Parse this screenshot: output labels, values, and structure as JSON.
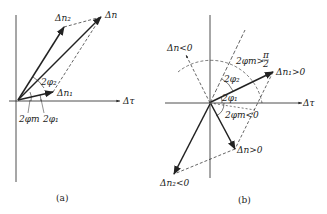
{
  "panel_a": {
    "caption": "(a)",
    "labels": {
      "dn2": "Δn₂",
      "dn": "Δn",
      "dn1": "Δn₁",
      "dtau": "Δτ",
      "phi2": "2φ₂",
      "phim": "2φm",
      "phi1": "2φ₁"
    }
  },
  "panel_b": {
    "caption": "(b)",
    "labels": {
      "dn_neg": "Δn<0",
      "phim_gt": "2φm>",
      "pi_over_2_num": "π",
      "pi_over_2_den": "2",
      "dn1_pos": "Δn₁>0",
      "phi2": "2φ₂",
      "phi1": "2φ₁",
      "dtau": "Δτ",
      "phim_lt": "2φm<0",
      "dn_pos": "Δn>0",
      "dn2_neg": "Δn₂<0"
    }
  },
  "colors": {
    "stroke": "#222222",
    "background": "#ffffff"
  }
}
